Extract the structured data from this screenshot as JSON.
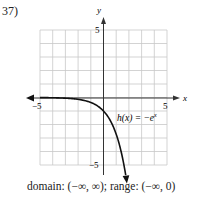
{
  "problem_number": "37)",
  "caption": "domain: (−∞, ∞); range: (−∞, 0)",
  "chart_data": {
    "type": "line",
    "title": "",
    "xlabel": "x",
    "ylabel": "y",
    "xlim": [
      -5,
      5
    ],
    "ylim": [
      -5,
      5
    ],
    "grid": true,
    "x_tick_labels": [
      "−5",
      "5"
    ],
    "y_tick_labels": [
      "5",
      "−5"
    ],
    "series": [
      {
        "name": "h(x) = −e^x",
        "x": [
          -5,
          -4,
          -3,
          -2,
          -1,
          0,
          0.5,
          1,
          1.5,
          1.7
        ],
        "values": [
          -0.007,
          -0.018,
          -0.05,
          -0.135,
          -0.368,
          -1,
          -1.649,
          -2.718,
          -4.482,
          -5.474
        ]
      }
    ],
    "annotations": [
      {
        "text": "h(x) = −e",
        "superscript": "x",
        "position": [
          1,
          -1.5
        ]
      }
    ],
    "colors": {
      "grid": "#c8c8c8",
      "axis": "#333333",
      "curve": "#111111"
    }
  },
  "labels": {
    "x_axis": "x",
    "y_axis": "y",
    "x_min": "−5",
    "x_max": "5",
    "y_max": "5",
    "y_min": "−5",
    "function_main": "h(x) = −e",
    "function_sup": "x"
  }
}
